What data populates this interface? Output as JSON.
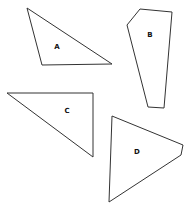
{
  "diagram": {
    "shapes": [
      {
        "label": "A",
        "points": "27,8 112,64 42,65",
        "label_pos": [
          57,
          47
        ]
      },
      {
        "label": "B",
        "points": "140,9 172,12 164,108 148,107 127,25",
        "label_pos": [
          150,
          35
        ]
      },
      {
        "label": "C",
        "points": "7,93 93,93 93,157",
        "label_pos": [
          67,
          111
        ]
      },
      {
        "label": "D",
        "points": "112,116 183,145 181,155 109,202",
        "label_pos": [
          137,
          152
        ]
      }
    ]
  }
}
